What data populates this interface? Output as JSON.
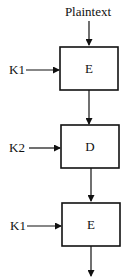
{
  "diagram": {
    "input_label": "Plaintext",
    "stages": [
      {
        "op": "E",
        "key": "K1"
      },
      {
        "op": "D",
        "key": "K2"
      },
      {
        "op": "E",
        "key": "K1"
      }
    ],
    "colors": {
      "stroke": "#111111",
      "background": "#ffffff"
    }
  }
}
